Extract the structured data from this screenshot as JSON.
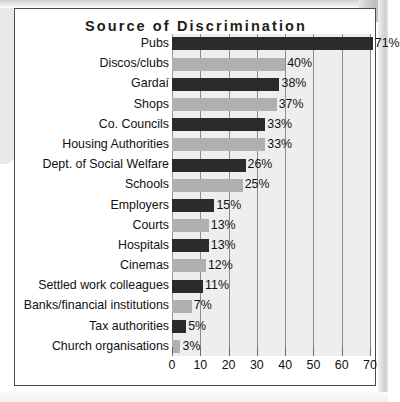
{
  "chart_data": {
    "type": "bar",
    "orientation": "horizontal",
    "title": "Source of Discrimination",
    "xlabel": "",
    "ylabel": "",
    "xlim": [
      0,
      70
    ],
    "xticks": [
      0,
      10,
      20,
      30,
      40,
      50,
      60,
      70
    ],
    "grid": true,
    "legend": "none",
    "value_suffix": "%",
    "colors": {
      "bar_dark": "#2b2b2b",
      "bar_light": "#b0b0b0",
      "plot_background": "#eeeeee",
      "gridline": "#8c8c8c",
      "frame": "#4a4a4a",
      "text": "#111111"
    },
    "categories": [
      "Pubs",
      "Discos/clubs",
      "Gardaí",
      "Shops",
      "Co. Councils",
      "Housing Authorities",
      "Dept. of Social Welfare",
      "Schools",
      "Employers",
      "Courts",
      "Hospitals",
      "Cinemas",
      "Settled work colleagues",
      "Banks/financial institutions",
      "Tax authorities",
      "Church organisations"
    ],
    "values": [
      71,
      40,
      38,
      37,
      33,
      33,
      26,
      25,
      15,
      13,
      13,
      12,
      11,
      7,
      5,
      3
    ],
    "value_labels": [
      "71%",
      "40%",
      "38%",
      "37%",
      "33%",
      "33%",
      "26%",
      "25%",
      "15%",
      "13%",
      "13%",
      "12%",
      "11%",
      "7%",
      "5%",
      "3%"
    ],
    "bar_shades": [
      "dark",
      "light",
      "dark",
      "light",
      "dark",
      "light",
      "dark",
      "light",
      "dark",
      "light",
      "dark",
      "light",
      "dark",
      "light",
      "dark",
      "light"
    ],
    "xtick_labels": [
      "0",
      "10",
      "20",
      "30",
      "40",
      "50",
      "60",
      "70"
    ]
  }
}
